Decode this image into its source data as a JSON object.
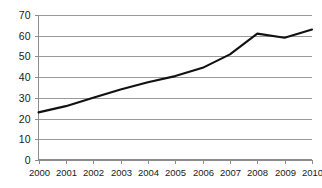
{
  "chart_data": {
    "type": "line",
    "title": "",
    "subtitle": "",
    "xlabel": "",
    "ylabel": "",
    "categories": [
      "2000",
      "2001",
      "2002",
      "2003",
      "2004",
      "2005",
      "2006",
      "2007",
      "2008",
      "2009",
      "2010"
    ],
    "x": [
      2000,
      2001,
      2002,
      2003,
      2004,
      2005,
      2006,
      2007,
      2008,
      2009,
      2010
    ],
    "values": [
      23,
      26,
      30,
      34,
      37.5,
      40.5,
      44.5,
      51,
      61,
      59,
      63
    ],
    "series": [
      {
        "name": "",
        "values": [
          23,
          26,
          30,
          34,
          37.5,
          40.5,
          44.5,
          51,
          61,
          59,
          63
        ],
        "color": "#111111"
      }
    ],
    "ylim": [
      0,
      70
    ],
    "yticks": [
      0,
      10,
      20,
      30,
      40,
      50,
      60,
      70
    ],
    "ytick_labels": [
      "0",
      "10",
      "20",
      "30",
      "40",
      "50",
      "60",
      "70"
    ],
    "xtick_labels": [
      "2000",
      "2001",
      "2002",
      "2003",
      "2004",
      "2005",
      "2006",
      "2007",
      "2008",
      "2009",
      "2010"
    ],
    "grid": true,
    "grid_axis": "y",
    "grid_color": "#9a9a9a",
    "axis_color": "#8c8c8c",
    "legend": false,
    "legend_position": "none",
    "annotations": []
  }
}
